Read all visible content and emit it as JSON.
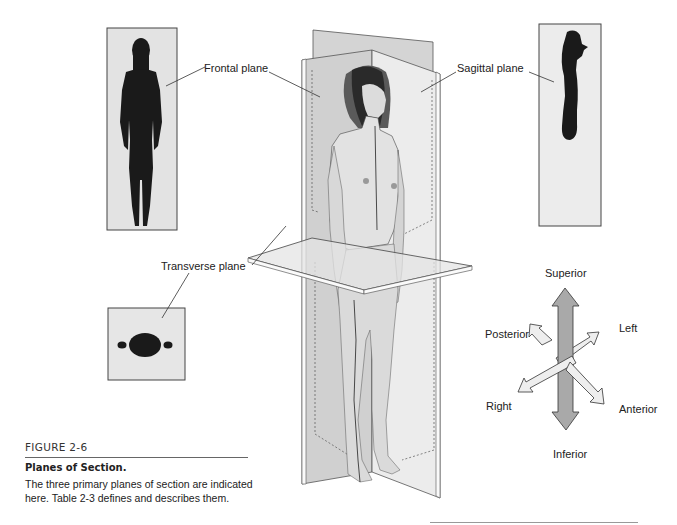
{
  "figure": {
    "number": "FIGURE 2-6",
    "title": "Planes of Section.",
    "caption": "The three primary planes of section are indicated here. Table 2-3 defines and describes them."
  },
  "planes": {
    "frontal": "Frontal plane",
    "sagittal": "Sagittal plane",
    "transverse": "Transverse plane"
  },
  "directions": {
    "superior": "Superior",
    "inferior": "Inferior",
    "left": "Left",
    "right": "Right",
    "anterior": "Anterior",
    "posterior": "Posterior"
  },
  "colors": {
    "silhouette": "#1a1a1a",
    "panel_bg": "#e6e6e6",
    "plane_fill": "#dcdcdc",
    "skin": "#d9d9d9",
    "arrow_dark": "#a8a8a8",
    "arrow_light": "#efefef"
  }
}
